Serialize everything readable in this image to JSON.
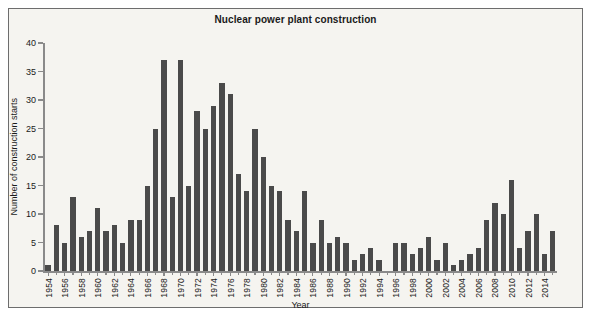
{
  "chart_data": {
    "type": "bar",
    "title": "Nuclear power plant construction",
    "xlabel": "Year",
    "ylabel": "Number of construction starts",
    "ylim": [
      0,
      40
    ],
    "ytick_values": [
      0,
      5,
      10,
      15,
      20,
      25,
      30,
      35,
      40
    ],
    "ytick_labels": [
      "0",
      "5",
      "10",
      "15",
      "20",
      "25",
      "30",
      "35",
      "40"
    ],
    "xtick_labels": [
      "1954",
      "1956",
      "1958",
      "1960",
      "1962",
      "1964",
      "1966",
      "1968",
      "1970",
      "1972",
      "1974",
      "1976",
      "1978",
      "1980",
      "1982",
      "1984",
      "1986",
      "1988",
      "1990",
      "1992",
      "1994",
      "1996",
      "1998",
      "2000",
      "2002",
      "2004",
      "2006",
      "2008",
      "2010",
      "2012",
      "2014"
    ],
    "xtick_step_years": 2,
    "grid": false,
    "legend": false,
    "bar_color": "#4a4a4a",
    "categories": [
      1954,
      1955,
      1956,
      1957,
      1958,
      1959,
      1960,
      1961,
      1962,
      1963,
      1964,
      1965,
      1966,
      1967,
      1968,
      1969,
      1970,
      1971,
      1972,
      1973,
      1974,
      1975,
      1976,
      1977,
      1978,
      1979,
      1980,
      1981,
      1982,
      1983,
      1984,
      1985,
      1986,
      1987,
      1988,
      1989,
      1990,
      1991,
      1992,
      1993,
      1994,
      1995,
      1996,
      1997,
      1998,
      1999,
      2000,
      2001,
      2002,
      2003,
      2004,
      2005,
      2006,
      2007,
      2008,
      2009,
      2010,
      2011,
      2012,
      2013,
      2014,
      2015
    ],
    "values": [
      1,
      8,
      5,
      13,
      6,
      7,
      11,
      7,
      8,
      5,
      9,
      9,
      15,
      25,
      37,
      13,
      37,
      15,
      28,
      25,
      29,
      33,
      31,
      17,
      14,
      25,
      20,
      15,
      14,
      9,
      7,
      14,
      5,
      9,
      5,
      6,
      5,
      2,
      3,
      4,
      2,
      0,
      5,
      5,
      3,
      4,
      6,
      2,
      5,
      1,
      2,
      3,
      4,
      9,
      12,
      10,
      16,
      4,
      7,
      10,
      3,
      7
    ]
  }
}
